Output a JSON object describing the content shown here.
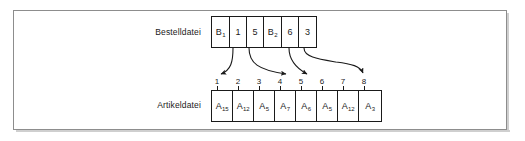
{
  "figure": {
    "title_present": false,
    "frame_color": "#8d8d8d",
    "line_color": "#1a1a1a",
    "background": "#ffffff"
  },
  "labels": {
    "top_row": "Bestelldatei",
    "bottom_row": "Artikeldatei"
  },
  "bestelldatei": {
    "cells": [
      {
        "base": "B",
        "sub": "1"
      },
      {
        "base": "1",
        "sub": ""
      },
      {
        "base": "5",
        "sub": ""
      },
      {
        "base": "B",
        "sub": "2"
      },
      {
        "base": "6",
        "sub": ""
      },
      {
        "base": "3",
        "sub": ""
      }
    ]
  },
  "artikeldatei": {
    "indices": [
      "1",
      "2",
      "3",
      "4",
      "5",
      "6",
      "7",
      "8"
    ],
    "cells": [
      {
        "base": "A",
        "sub": "15"
      },
      {
        "base": "A",
        "sub": "12"
      },
      {
        "base": "A",
        "sub": "5"
      },
      {
        "base": "A",
        "sub": "7"
      },
      {
        "base": "A",
        "sub": "6"
      },
      {
        "base": "A",
        "sub": "5"
      },
      {
        "base": "A",
        "sub": "12"
      },
      {
        "base": "A",
        "sub": "3"
      }
    ]
  },
  "pointers": [
    {
      "from_cell": "1",
      "from_value": "1",
      "to_index": "1"
    },
    {
      "from_cell": "2",
      "from_value": "5",
      "to_index": "5"
    },
    {
      "from_cell": "4",
      "from_value": "6",
      "to_index": "6"
    },
    {
      "from_cell": "5",
      "from_value": "3",
      "to_index": "8"
    }
  ]
}
